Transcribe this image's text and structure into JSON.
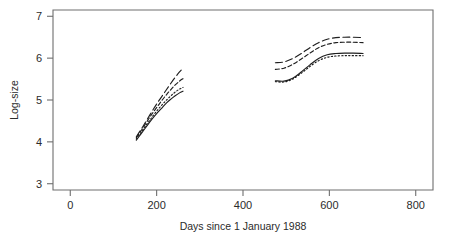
{
  "chart_data": {
    "type": "line",
    "title": "",
    "subtitle": "",
    "xlabel": "Days since 1 January 1988",
    "ylabel": "Log-size",
    "xlim": [
      -40,
      840
    ],
    "ylim": [
      2.85,
      7.15
    ],
    "xticks": [
      0,
      200,
      400,
      600,
      800
    ],
    "yticks": [
      3,
      4,
      5,
      6,
      7
    ],
    "xtick_labels": [
      "0",
      "200",
      "400",
      "600",
      "800"
    ],
    "ytick_labels": [
      "3",
      "4",
      "5",
      "6",
      "7"
    ],
    "grid": false,
    "legend": "none",
    "annotations": [],
    "note": "Two disjoint growth episodes; four quantile curves per episode (long-dash, short-dash, dotted, solid).",
    "series": [
      {
        "name": "long-dash",
        "style": "long-dash",
        "dasharray": "7,3.5",
        "x": [
          153,
          163,
          173,
          183,
          193,
          203,
          213,
          223,
          233,
          243,
          253,
          261
        ],
        "y": [
          4.12,
          4.28,
          4.45,
          4.62,
          4.79,
          4.95,
          5.1,
          5.25,
          5.4,
          5.54,
          5.67,
          5.76
        ]
      },
      {
        "name": "short-dash",
        "style": "short-dash",
        "dasharray": "4,2.5",
        "x": [
          153,
          163,
          173,
          183,
          193,
          203,
          213,
          223,
          233,
          243,
          253,
          261
        ],
        "y": [
          4.1,
          4.25,
          4.41,
          4.57,
          4.72,
          4.86,
          5.0,
          5.13,
          5.25,
          5.36,
          5.45,
          5.51
        ]
      },
      {
        "name": "dotted",
        "style": "dotted",
        "dasharray": "1.3,2.2",
        "x": [
          153,
          163,
          173,
          183,
          193,
          203,
          213,
          223,
          233,
          243,
          253,
          261
        ],
        "y": [
          4.07,
          4.21,
          4.36,
          4.5,
          4.64,
          4.77,
          4.89,
          5.0,
          5.1,
          5.19,
          5.26,
          5.3
        ]
      },
      {
        "name": "solid",
        "style": "solid",
        "dasharray": "none",
        "x": [
          153,
          163,
          173,
          183,
          193,
          203,
          213,
          223,
          233,
          243,
          253,
          261
        ],
        "y": [
          4.04,
          4.18,
          4.32,
          4.46,
          4.59,
          4.71,
          4.82,
          4.93,
          5.02,
          5.1,
          5.17,
          5.21
        ]
      },
      {
        "name": "long-dash-2",
        "style": "long-dash",
        "dasharray": "7,3.5",
        "x": [
          475,
          495,
          515,
          535,
          555,
          575,
          595,
          615,
          635,
          655,
          678
        ],
        "y": [
          5.89,
          5.91,
          5.99,
          6.11,
          6.25,
          6.37,
          6.45,
          6.49,
          6.5,
          6.5,
          6.49
        ]
      },
      {
        "name": "short-dash-2",
        "style": "short-dash",
        "dasharray": "4,2.5",
        "x": [
          475,
          495,
          515,
          535,
          555,
          575,
          595,
          615,
          635,
          655,
          678
        ],
        "y": [
          5.73,
          5.76,
          5.85,
          5.98,
          6.12,
          6.25,
          6.33,
          6.37,
          6.38,
          6.38,
          6.37
        ]
      },
      {
        "name": "solid-2",
        "style": "solid",
        "dasharray": "none",
        "x": [
          475,
          495,
          515,
          535,
          555,
          575,
          595,
          615,
          635,
          655,
          678
        ],
        "y": [
          5.46,
          5.45,
          5.52,
          5.67,
          5.84,
          5.99,
          6.08,
          6.11,
          6.12,
          6.12,
          6.11
        ]
      },
      {
        "name": "dotted-2",
        "style": "dotted",
        "dasharray": "1.3,2.2",
        "x": [
          475,
          495,
          515,
          535,
          555,
          575,
          595,
          615,
          635,
          655,
          678
        ],
        "y": [
          5.44,
          5.43,
          5.5,
          5.64,
          5.8,
          5.94,
          6.02,
          6.05,
          6.06,
          6.06,
          6.06
        ]
      }
    ]
  },
  "figure": {
    "background_color": "#ffffff",
    "axis_color": "#6e6e6e",
    "line_color": "#1f1f1f"
  }
}
